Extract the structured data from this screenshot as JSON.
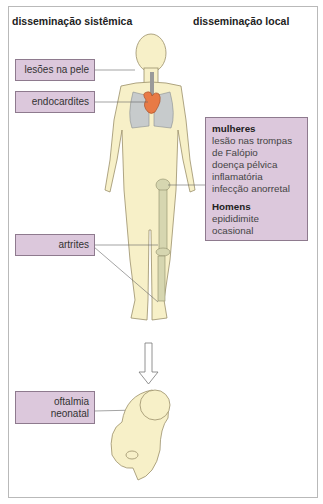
{
  "headers": {
    "systemic": "disseminação sistêmica",
    "local": "disseminação local"
  },
  "labels": {
    "skin": "lesões na pele",
    "endocarditis": "endocardites",
    "arthritis": "artrites",
    "neonatal_line1": "oftalmia",
    "neonatal_line2": "neonatal"
  },
  "local_box": {
    "women_title": "mulheres",
    "women_items": [
      "lesão nas trompas",
      "de Falópio",
      "doença pélvica",
      "inflamatória",
      "infecção anorretal"
    ],
    "men_title": "Homens",
    "men_items": [
      "epididimite",
      "ocasional"
    ]
  },
  "colors": {
    "label_fill": "#dcc8dc",
    "label_border": "#8e7a8e",
    "skin": "#f7f0c8",
    "lungs": "#c7cbcc",
    "heart": "#e87a45",
    "bone": "#d6d6b0"
  }
}
